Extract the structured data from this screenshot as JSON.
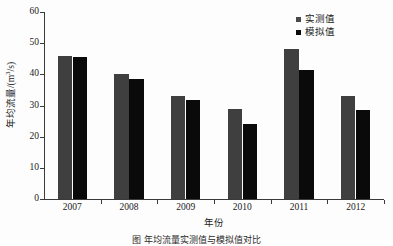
{
  "figure": {
    "caption": "图          年均流量实测值与模拟值对比",
    "background_color": "#fdfdfd"
  },
  "legend": {
    "position": "top-right",
    "items": [
      {
        "label": "实测值",
        "color": "#4a4a4a",
        "swatch": "square-marker-icon"
      },
      {
        "label": "模拟值",
        "color": "#0a0a0a",
        "swatch": "square-marker-icon"
      }
    ]
  },
  "axes": {
    "y_label": "年均流量/(m",
    "y_label_sup": "3",
    "y_label_tail": "/s)",
    "y_label_full": "年均流量/(m³/s)",
    "x_label": "年份",
    "y_ticks": [
      "0",
      "10",
      "20",
      "30",
      "40",
      "50",
      "60"
    ],
    "x_ticks": [
      "2007",
      "2008",
      "2009",
      "2010",
      "2011",
      "2012"
    ]
  },
  "chart_data": {
    "type": "bar",
    "title": "",
    "xlabel": "年份",
    "ylabel": "年均流量/(m³/s)",
    "ylim": [
      0,
      60
    ],
    "ytick_step": 10,
    "grid": false,
    "legend_position": "upper right",
    "categories": [
      "2007",
      "2008",
      "2009",
      "2010",
      "2011",
      "2012"
    ],
    "series": [
      {
        "name": "实测值",
        "color": "#3f3f3f",
        "values": [
          45.8,
          40.0,
          33.0,
          29.0,
          48.0,
          33.2
        ]
      },
      {
        "name": "模拟值",
        "color": "#0a0a0a",
        "values": [
          45.7,
          38.5,
          31.8,
          24.0,
          41.5,
          28.7
        ]
      }
    ]
  }
}
